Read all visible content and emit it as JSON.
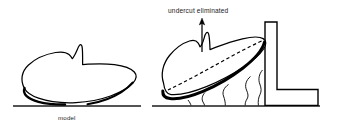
{
  "figure": {
    "background_color": "#ffffff",
    "ink_color": "#000000",
    "text_color": "#1b1b1b",
    "width": 344,
    "height": 131
  },
  "left_panel": {
    "name": "flat-orientation",
    "caption": "model",
    "baseline": {
      "label": "build-platform-line",
      "x_start": 13,
      "x_end": 141,
      "y": 106
    },
    "part": {
      "label": "model-outline-flat",
      "description": "organic blob profile with pointed fin notch on upper surface, resting flat on build platform",
      "fill": "#ffffff",
      "stroke": "#000000"
    }
  },
  "right_panel": {
    "name": "tilted-orientation",
    "annotation": "undercut eliminated",
    "baseline": {
      "label": "build-platform-line",
      "x_start": 152,
      "x_end": 320,
      "y": 106
    },
    "part": {
      "label": "model-outline-tilted",
      "description": "same organic blob profile rotated and leaning against the vertical wall, heavy stroke on lower-right contour",
      "fill": "#ffffff",
      "stroke": "#000000"
    },
    "center_line": {
      "label": "tilt-axis-dashed",
      "style": "dashed",
      "description": "dashed line running along the long axis of the tilted part"
    },
    "arrow": {
      "label": "undercut-callout-arrow",
      "direction": "up",
      "x": 202,
      "y_tail": 52,
      "y_head": 19
    },
    "supports": {
      "label": "support-structures",
      "count": 3,
      "description": "wavy organic support columns between the tilted part and the build platform"
    },
    "wall": {
      "label": "l-shaped-wall",
      "description": "L-shaped vertical wall with horizontal foot extending to the right",
      "vertical_top_y": 22,
      "vertical_left_x": 265,
      "vertical_right_x": 277,
      "foot_right_x": 318,
      "foot_top_y": 89
    }
  }
}
